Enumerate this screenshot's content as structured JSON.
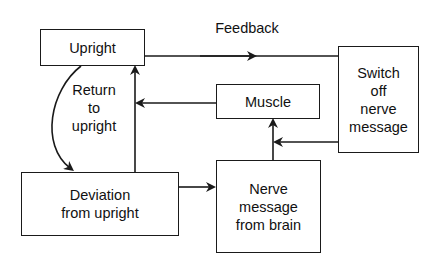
{
  "diagram": {
    "type": "flowchart",
    "title": "",
    "nodes": [
      {
        "id": "upright",
        "lines": [
          "Upright"
        ]
      },
      {
        "id": "deviation",
        "lines": [
          "Deviation",
          "from upright"
        ]
      },
      {
        "id": "nerve",
        "lines": [
          "Nerve",
          "message",
          "from brain"
        ]
      },
      {
        "id": "muscle",
        "lines": [
          "Muscle"
        ]
      },
      {
        "id": "switch",
        "lines": [
          "Switch",
          "off",
          "nerve",
          "message"
        ]
      }
    ],
    "labels": {
      "feedback": "Feedback",
      "return": [
        "Return",
        "to",
        "upright"
      ]
    },
    "edges": [
      {
        "from": "upright",
        "to": "switch",
        "label": "Feedback"
      },
      {
        "from": "upright",
        "to": "deviation",
        "label": "Return to upright",
        "style": "curved"
      },
      {
        "from": "deviation",
        "to": "upright"
      },
      {
        "from": "deviation",
        "to": "nerve"
      },
      {
        "from": "nerve",
        "to": "muscle"
      },
      {
        "from": "switch",
        "to": "muscle"
      },
      {
        "from": "muscle",
        "to": "upright"
      }
    ]
  }
}
